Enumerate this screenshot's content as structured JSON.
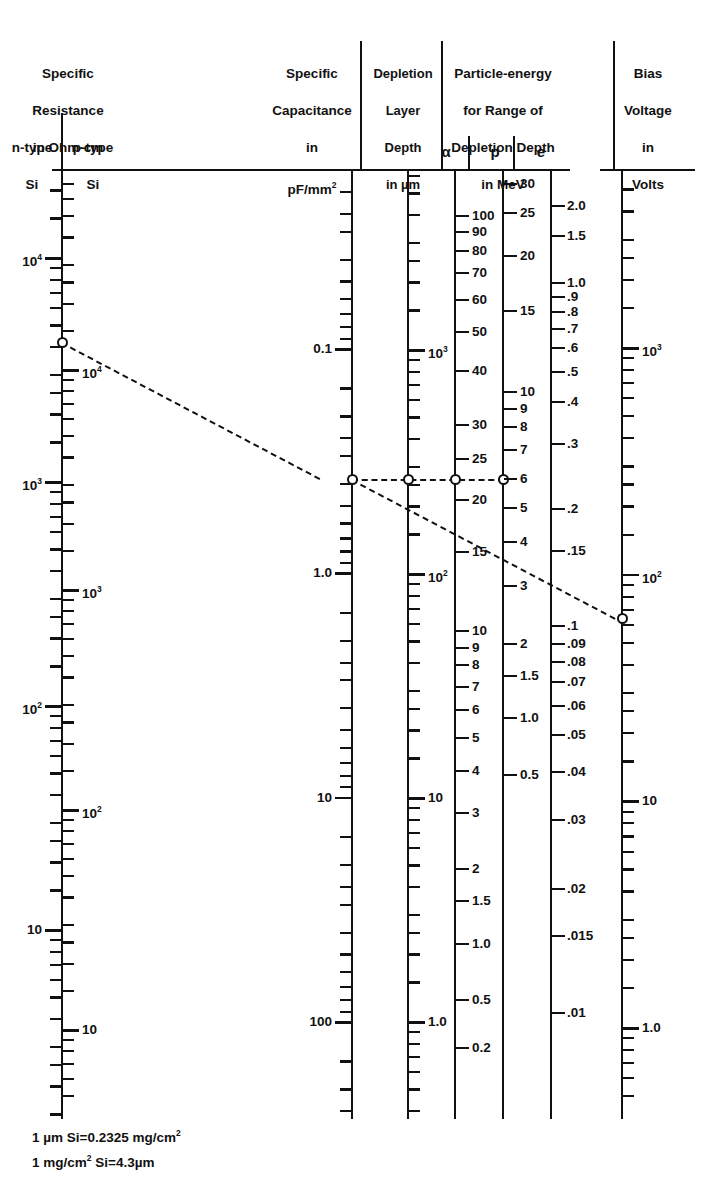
{
  "figure": {
    "type": "nomogram",
    "title_columns": [
      {
        "name": "specific-resistance",
        "lines": [
          "Specific",
          "Resistance",
          "in Ohm·cm"
        ],
        "sub_labels": [
          "n-type",
          "p-type",
          "Si",
          "Si"
        ]
      },
      {
        "name": "specific-capacitance",
        "lines": [
          "Specific",
          "Capacitance",
          "in",
          "pF/mm2"
        ]
      },
      {
        "name": "depletion-layer-depth",
        "lines": [
          "Depletion",
          "Layer",
          "Depth",
          "in µm"
        ]
      },
      {
        "name": "particle-energy",
        "lines": [
          "Particle-energy",
          "for Range of",
          "Depletion Depth",
          "in MeV"
        ],
        "columns": [
          "α",
          "p",
          "e"
        ]
      },
      {
        "name": "bias-voltage",
        "lines": [
          "Bias",
          "Voltage",
          "in",
          "Volts"
        ]
      }
    ],
    "footnotes": [
      "1 µm Si=0.2325 mg/cm2",
      "1 mg/cm2 Si=4.3µm"
    ],
    "ink_color": "#111111",
    "background": "#ffffff"
  },
  "chart_data": {
    "type": "nomogram",
    "axes": [
      {
        "id": "rho-n",
        "label": "Specific Resistance in Ohm·cm, n-type Si",
        "side": "left",
        "scale": "log",
        "labels": [
          "10^4",
          "10^3",
          "10^2",
          "10"
        ],
        "label_text": [
          "104",
          "103",
          "102",
          "10"
        ]
      },
      {
        "id": "rho-p",
        "label": "Specific Resistance in Ohm·cm, p-type Si",
        "side": "right",
        "scale": "log",
        "labels": [
          "10^4",
          "10^3",
          "10^2",
          "10"
        ],
        "label_text": [
          "104",
          "103",
          "102",
          "10"
        ]
      },
      {
        "id": "capacitance",
        "label": "Specific Capacitance in pF/mm2",
        "side": "left",
        "scale": "log",
        "labels": [
          "0.1",
          "1.0",
          "10",
          "100"
        ]
      },
      {
        "id": "depth",
        "label": "Depletion Layer Depth in µm",
        "side": "right",
        "scale": "log",
        "labels": [
          "103",
          "102",
          "10",
          "1.0"
        ]
      },
      {
        "id": "alpha",
        "label": "Particle energy for range of depletion depth, alpha, MeV",
        "side": "right",
        "scale": "log",
        "labels": [
          "100",
          "90",
          "80",
          "70",
          "60",
          "50",
          "40",
          "30",
          "25",
          "20",
          "15",
          "10",
          "9",
          "8",
          "7",
          "6",
          "5",
          "4",
          "3",
          "2",
          "1.5",
          "1.0",
          "0.5",
          "0.2"
        ]
      },
      {
        "id": "proton",
        "label": "Particle energy for range of depletion depth, proton, MeV",
        "side": "right",
        "scale": "log",
        "labels": [
          "30",
          "25",
          "20",
          "15",
          "10",
          "9",
          "8",
          "7",
          "6",
          "5",
          "4",
          "3",
          "2",
          "1.5",
          "1.0",
          "0.5"
        ]
      },
      {
        "id": "electron",
        "label": "Particle energy for range of depletion depth, electron, MeV",
        "side": "right",
        "scale": "log",
        "labels": [
          "2.0",
          "1.5",
          "1.0",
          ".9",
          ".8",
          ".7",
          ".6",
          ".5",
          ".4",
          ".3",
          ".2",
          ".15",
          ".1",
          ".09",
          ".08",
          ".07",
          ".06",
          ".05",
          ".04",
          ".03",
          ".02",
          ".015",
          ".01"
        ]
      },
      {
        "id": "bias",
        "label": "Bias Voltage in Volts",
        "side": "right",
        "scale": "log",
        "labels": [
          "103",
          "102",
          "10",
          "1.0"
        ]
      }
    ],
    "index_line": {
      "description": "Dashed construction line through example working point",
      "points": [
        {
          "axis": "rho-n",
          "value": "≈7000 Ohm·cm"
        },
        {
          "axis": "capacitance",
          "value": "≈0.35 pF/mm2"
        },
        {
          "axis": "depth",
          "value": "≈23 µm"
        },
        {
          "axis": "alpha",
          "value": "≈23 MeV"
        },
        {
          "axis": "proton",
          "value": "≈6 MeV"
        },
        {
          "axis": "electron",
          "value": "≈0.27 MeV"
        },
        {
          "axis": "bias",
          "value": "≈70 V"
        }
      ]
    }
  },
  "geometry": {
    "top_rule_y": 169,
    "axes_x": {
      "res": 62,
      "cap": 352,
      "depth": 408,
      "alpha": 455,
      "proton": 503,
      "bias": 622
    },
    "markers": [
      {
        "name": "marker-resistance",
        "x": 62,
        "y": 342
      },
      {
        "name": "marker-capacitance",
        "x": 352,
        "y": 479
      },
      {
        "name": "marker-depth",
        "x": 408,
        "y": 479
      },
      {
        "name": "marker-proton",
        "x": 455,
        "y": 479
      },
      {
        "name": "marker-electron",
        "x": 503,
        "y": 479
      },
      {
        "name": "marker-bias",
        "x": 622,
        "y": 618
      }
    ]
  }
}
